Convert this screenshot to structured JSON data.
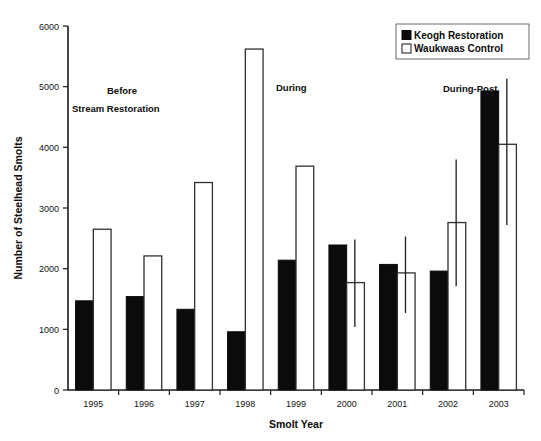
{
  "chart_data": {
    "type": "bar",
    "title": "",
    "xlabel": "Smolt Year",
    "ylabel": "Number of Steelhead Smolts",
    "categories": [
      "1995",
      "1996",
      "1997",
      "1998",
      "1999",
      "2000",
      "2001",
      "2002",
      "2003"
    ],
    "ylim": [
      0,
      6000
    ],
    "yticks": [
      0,
      1000,
      2000,
      3000,
      4000,
      5000,
      6000
    ],
    "ytick_labels": [
      "0",
      "1000",
      "2000",
      "3000",
      "4000",
      "5000",
      "6000"
    ],
    "grid": false,
    "legend_position": "top-right",
    "series": [
      {
        "name": "Keogh Restoration",
        "style": "filled",
        "color": "#0b0b0b",
        "values": [
          1470,
          1540,
          1330,
          960,
          2140,
          2390,
          2070,
          1960,
          4930
        ],
        "errors": [
          null,
          null,
          null,
          null,
          null,
          null,
          null,
          null,
          null
        ]
      },
      {
        "name": "Waukwaas Control",
        "style": "open",
        "color": "#ffffff",
        "values": [
          2650,
          2210,
          3420,
          5620,
          3690,
          1770,
          1930,
          2760,
          4050
        ],
        "errors": [
          null,
          null,
          null,
          null,
          null,
          {
            "low": 1040,
            "high": 2480
          },
          {
            "low": 1270,
            "high": 2530
          },
          {
            "low": 1710,
            "high": 3800
          },
          {
            "low": 2720,
            "high": 5130
          }
        ]
      }
    ],
    "annotations": [
      {
        "text": "Before",
        "x": "1996",
        "y": 5000
      },
      {
        "text": "Stream Restoration",
        "x": "1996",
        "y": 4750
      },
      {
        "text": "During",
        "x": "1999",
        "y": 5000
      },
      {
        "text": "During-Post",
        "x": "2003",
        "y": 5150
      }
    ]
  },
  "axis": {
    "y_title": "Number of Steelhead Smolts",
    "x_title": "Smolt Year",
    "y_ticks": [
      "6000",
      "5000",
      "4000",
      "3000",
      "2000",
      "1000",
      "0"
    ],
    "x_ticks": [
      "1995",
      "1996",
      "1997",
      "1998",
      "1999",
      "2000",
      "2001",
      "2002",
      "2003"
    ]
  },
  "legend": {
    "entries": [
      {
        "label": "Keogh Restoration",
        "swatch": "filled-square"
      },
      {
        "label": "Waukwaas Control",
        "swatch": "open-square"
      }
    ]
  },
  "annotations": {
    "before_line1": "Before",
    "before_line2": "Stream Restoration",
    "during": "During",
    "during_post": "During-Post"
  }
}
